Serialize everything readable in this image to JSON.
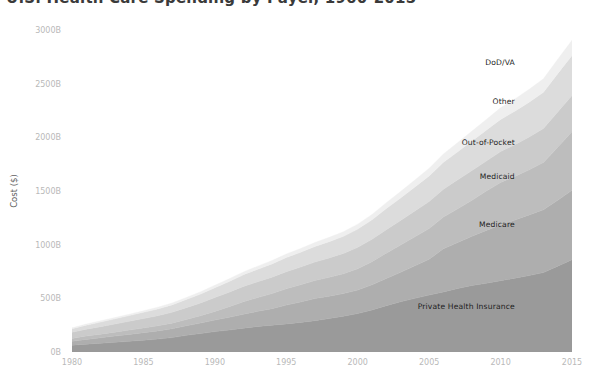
{
  "chart_data": {
    "type": "area",
    "stacked": true,
    "title": "U.S. Health Care Spending by Payer, 1960-2015",
    "xlabel": "",
    "ylabel": "Cost ($)",
    "xlim": [
      1980,
      2015
    ],
    "ylim": [
      0,
      3000
    ],
    "grid": false,
    "legend_position": "inline-right",
    "y_tick_labels": [
      "3000B",
      "2500B",
      "2000B",
      "1500B",
      "1000B",
      "500B",
      "0B"
    ],
    "y_tick_values": [
      3000,
      2500,
      2000,
      1500,
      1000,
      500,
      0
    ],
    "x_tick_labels": [
      "1980",
      "1985",
      "1990",
      "1995",
      "2000",
      "2005",
      "2010",
      "2015"
    ],
    "x_tick_values": [
      1980,
      1985,
      1990,
      1995,
      2000,
      2005,
      2010,
      2015
    ],
    "x": [
      1980,
      1981,
      1982,
      1983,
      1984,
      1985,
      1986,
      1987,
      1988,
      1989,
      1990,
      1991,
      1992,
      1993,
      1994,
      1995,
      1996,
      1997,
      1998,
      1999,
      2000,
      2001,
      2002,
      2003,
      2004,
      2005,
      2006,
      2007,
      2008,
      2009,
      2010,
      2011,
      2012,
      2013,
      2014,
      2015
    ],
    "series": [
      {
        "name": "Private Health Insurance",
        "color": "#9a9a9a",
        "label_x": 2011,
        "label_y": 430,
        "values": [
          62,
          73,
          82,
          90,
          100,
          110,
          120,
          134,
          155,
          172,
          190,
          205,
          222,
          238,
          250,
          262,
          276,
          292,
          312,
          334,
          358,
          392,
          432,
          468,
          500,
          530,
          560,
          592,
          620,
          640,
          664,
          688,
          712,
          740,
          800,
          860
        ]
      },
      {
        "name": "Medicare",
        "color": "#aeaeae",
        "label_x": 2011,
        "label_y": 1190,
        "values": [
          37,
          44,
          51,
          58,
          64,
          70,
          76,
          82,
          89,
          98,
          108,
          118,
          130,
          141,
          154,
          175,
          190,
          206,
          208,
          210,
          219,
          234,
          253,
          274,
          303,
          334,
          401,
          428,
          458,
          493,
          519,
          542,
          565,
          585,
          614,
          646
        ]
      },
      {
        "name": "Medicaid",
        "color": "#bdbdbd",
        "label_x": 2011,
        "label_y": 1640,
        "values": [
          26,
          31,
          33,
          37,
          40,
          44,
          48,
          53,
          59,
          68,
          80,
          98,
          116,
          128,
          140,
          152,
          160,
          168,
          176,
          184,
          198,
          216,
          236,
          254,
          270,
          286,
          296,
          314,
          336,
          366,
          396,
          406,
          420,
          441,
          493,
          545
        ]
      },
      {
        "name": "Out-of-Pocket",
        "color": "#cbcbcb",
        "label_x": 2011,
        "label_y": 1960,
        "values": [
          58,
          64,
          70,
          76,
          82,
          88,
          94,
          101,
          110,
          119,
          129,
          136,
          143,
          148,
          153,
          159,
          165,
          172,
          180,
          190,
          200,
          208,
          219,
          229,
          240,
          252,
          260,
          270,
          277,
          280,
          288,
          296,
          306,
          316,
          330,
          338
        ]
      },
      {
        "name": "Other",
        "color": "#dcdcdc",
        "label_x": 2011,
        "label_y": 2340,
        "values": [
          33,
          38,
          43,
          48,
          53,
          58,
          63,
          69,
          76,
          83,
          92,
          100,
          108,
          116,
          124,
          132,
          138,
          145,
          152,
          160,
          170,
          182,
          196,
          210,
          224,
          238,
          250,
          262,
          275,
          288,
          300,
          312,
          325,
          338,
          356,
          374
        ]
      },
      {
        "name": "DoD/VA",
        "color": "#efefef",
        "label_x": 2011,
        "label_y": 2700,
        "values": [
          9,
          10,
          11,
          12,
          13,
          14,
          16,
          17,
          19,
          21,
          23,
          25,
          27,
          29,
          31,
          33,
          35,
          37,
          40,
          43,
          46,
          50,
          55,
          60,
          66,
          72,
          78,
          85,
          92,
          100,
          108,
          114,
          120,
          126,
          134,
          142
        ]
      }
    ]
  }
}
